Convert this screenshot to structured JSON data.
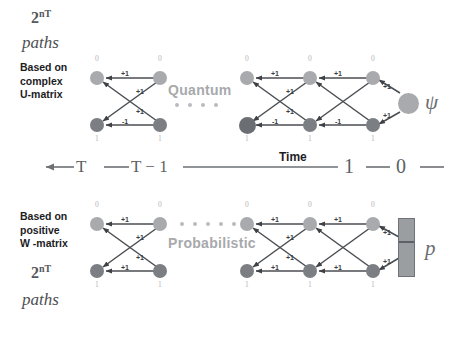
{
  "figure": {
    "title_left_top": {
      "power_base": "2",
      "power_exp": "nT",
      "paths_word": "paths"
    },
    "title_left_bottom": {
      "power_base": "2",
      "power_exp": "nT",
      "paths_word": "paths"
    },
    "quantum_caption": {
      "line1": "Based on",
      "line2": "complex",
      "line3": "U-matrix"
    },
    "probabilistic_caption": {
      "line1": "Based on",
      "line2": "positive",
      "line3": "W -matrix"
    },
    "quantum_word": "Quantum",
    "probabilistic_word": "Probabilistic",
    "psi_symbol": "ψ",
    "p_symbol": "p",
    "time_axis": {
      "label": "Time",
      "ticks": [
        "T",
        "T − 1",
        "1",
        "0"
      ]
    },
    "state_labels": {
      "top": "0",
      "bottom": "1"
    },
    "quantum_amplitudes": {
      "horizontal_top": [
        "+1",
        "+1",
        "+1"
      ],
      "horizontal_bottom": [
        "-1",
        "-1",
        "-1"
      ],
      "diagonal_upper": [
        "+1",
        "+1"
      ],
      "diagonal_lower": [
        "+1",
        "+1"
      ],
      "collapse": [
        "+1",
        "+1"
      ]
    },
    "probabilistic_amplitudes": {
      "horizontal_top": [
        "+1",
        "+1",
        "+1"
      ],
      "horizontal_bottom": [
        "+1",
        "+1",
        "+1"
      ],
      "diagonal_upper": [
        "+1",
        "+1"
      ],
      "diagonal_lower": [
        "+1",
        "+1"
      ],
      "collapse": [
        "+1",
        "+1"
      ]
    },
    "colors": {
      "node_light": "#a8aaad",
      "node_dark": "#7b7e82",
      "node_highlight": "#6b6e72",
      "edge": "#4a4d51",
      "muted_text": "#a7a9ac",
      "body_text": "#1d1d1f"
    }
  }
}
